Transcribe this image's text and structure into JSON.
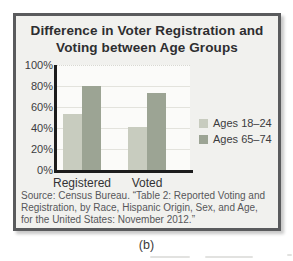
{
  "figure": {
    "caption": "(b)",
    "title_line1": "Difference in Voter Registration and",
    "title_line2": "Voting between Age Groups",
    "source_lines": [
      "Source: Census Bureau. “Table 2: Reported Voting and",
      "Registration, by Race, Hispanic Origin, Sex, and Age,",
      "for the United States: November 2012.”"
    ]
  },
  "chart_data": {
    "type": "bar",
    "title": "Difference in Voter Registration and Voting between Age Groups",
    "categories": [
      "Registered",
      "Voted"
    ],
    "series": [
      {
        "name": "Ages 18–24",
        "values": [
          53,
          41
        ],
        "color": "#c8ccbf"
      },
      {
        "name": "Ages 65–74",
        "values": [
          80,
          73
        ],
        "color": "#9ca494"
      }
    ],
    "xlabel": "",
    "ylabel": "",
    "ylim": [
      0,
      100
    ],
    "yticks": [
      "0%",
      "20%",
      "40%",
      "60%",
      "80%",
      "100%"
    ],
    "grid": true,
    "legend_position": "right",
    "axis_color": "#1c1c1c",
    "plot_background": "#fbfbf9"
  }
}
